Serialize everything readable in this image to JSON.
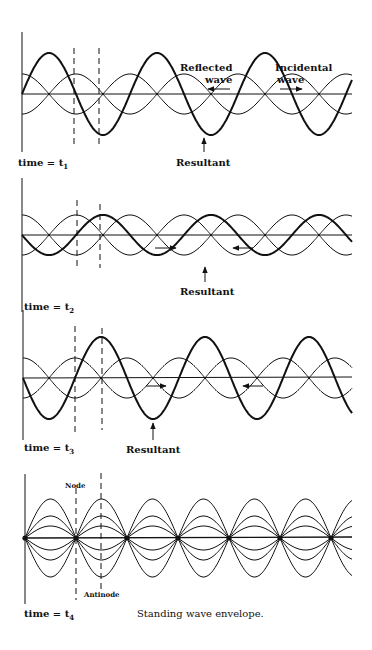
{
  "panels": [
    {
      "id": "t1",
      "time_label": "time = t",
      "time_sub": "1",
      "labels": {
        "reflected_1": "Reflected",
        "reflected_2": "wave",
        "incidental_1": "Incidental",
        "incidental_2": "wave",
        "resultant": "Resultant"
      }
    },
    {
      "id": "t2",
      "time_label": "time = t",
      "time_sub": "2",
      "labels": {
        "resultant": "Resultant"
      }
    },
    {
      "id": "t3",
      "time_label": "time = t",
      "time_sub": "3",
      "labels": {
        "resultant": "Resultant"
      }
    },
    {
      "id": "t4",
      "time_label": "time = t",
      "time_sub": "4",
      "labels": {
        "node": "Node",
        "antinode": "Antinode",
        "caption": "Standing wave envelope."
      }
    }
  ],
  "colors": {
    "ink": "#111111",
    "background": "#ffffff"
  }
}
